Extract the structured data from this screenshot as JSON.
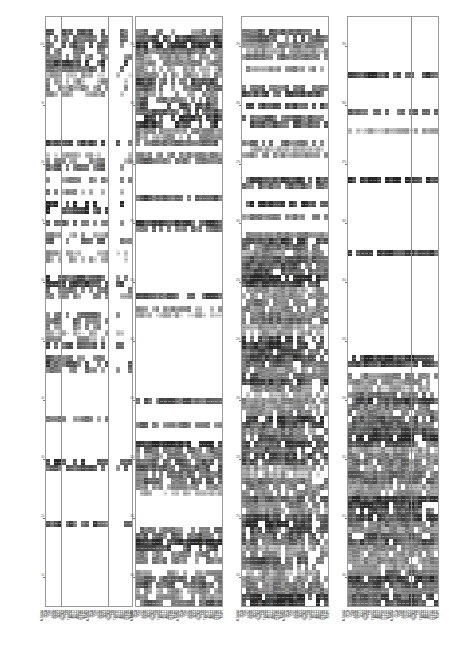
{
  "figure": {
    "type": "multi-panel-heatmap-matrix",
    "panel_count": 4,
    "background": "#ffffff",
    "colormap": "greyscale",
    "colormap_low": "#ffffff",
    "colormap_high": "#1a1a1a",
    "cell_text_light": "#f2f2f2",
    "cell_text_dark": "#3a3a3a",
    "frame_color": "#9a9a9a"
  },
  "chart_data": {
    "type": "heatmap",
    "title": "",
    "xlabel": "",
    "ylabel": "",
    "grid": false,
    "legend": "none",
    "panels": [
      {
        "name": "panel-1",
        "yticks": [
          "100",
          "90",
          "80",
          "70",
          "60",
          "50",
          "40",
          "30",
          "20",
          "10"
        ],
        "ylim": [
          0,
          105
        ],
        "columns": [
          "ALDH1A1",
          "GCLC",
          "GCLM",
          "GPX2",
          "GSR",
          "GSTA1",
          "GSTM1",
          "GSTP1",
          "NQO1",
          "PRDX1",
          "SLC7A11",
          "SRXN1",
          "TXN",
          "TXNRD1",
          "ABCB1",
          "ABCC1",
          "ABCC2",
          "ABCG2",
          "CYP1A1",
          "CYP1B1",
          "NFE2L2",
          "KEAP1"
        ],
        "rows": 96,
        "values": []
      },
      {
        "name": "panel-2",
        "yticks": [
          "190",
          "180",
          "170",
          "160",
          "150",
          "140",
          "130",
          "120",
          "110",
          "100"
        ],
        "ylim": [
          95,
          195
        ],
        "columns": [
          "ALDH1A1",
          "GCLC",
          "GCLM",
          "GPX2",
          "GSR",
          "GSTA1",
          "GSTM1",
          "GSTP1",
          "NQO1",
          "PRDX1",
          "SLC7A11",
          "SRXN1",
          "TXN",
          "TXNRD1",
          "ABCB1",
          "ABCC1",
          "ABCC2",
          "ABCG2",
          "CYP1A1",
          "CYP1B1",
          "NFE2L2",
          "KEAP1"
        ],
        "rows": 96,
        "values": []
      },
      {
        "name": "panel-3",
        "yticks": [
          "290",
          "280",
          "270",
          "260",
          "250",
          "240",
          "230",
          "220",
          "210",
          "200"
        ],
        "ylim": [
          195,
          295
        ],
        "columns": [
          "ALDH1A1",
          "GCLC",
          "GCLM",
          "GPX2",
          "GSR",
          "GSTA1",
          "GSTM1",
          "GSTP1",
          "NQO1",
          "PRDX1",
          "SLC7A11",
          "SRXN1",
          "TXN",
          "TXNRD1",
          "ABCB1",
          "ABCC1",
          "ABCC2",
          "ABCG2",
          "CYP1A1",
          "CYP1B1",
          "NFE2L2",
          "KEAP1"
        ],
        "rows": 96,
        "values": []
      },
      {
        "name": "panel-4",
        "yticks": [
          "390",
          "380",
          "370",
          "360",
          "350",
          "340",
          "330",
          "320",
          "310",
          "300"
        ],
        "ylim": [
          295,
          395
        ],
        "columns": [
          "ALDH1A1",
          "GCLC",
          "GCLM",
          "GPX2",
          "GSR",
          "GSTA1",
          "GSTM1",
          "GSTP1",
          "NQO1",
          "PRDX1",
          "SLC7A11",
          "SRXN1",
          "TXN",
          "TXNRD1",
          "ABCB1",
          "ABCC1",
          "ABCC2",
          "ABCG2",
          "CYP1A1",
          "CYP1B1",
          "NFE2L2",
          "KEAP1"
        ],
        "rows": 96,
        "values": []
      }
    ]
  }
}
